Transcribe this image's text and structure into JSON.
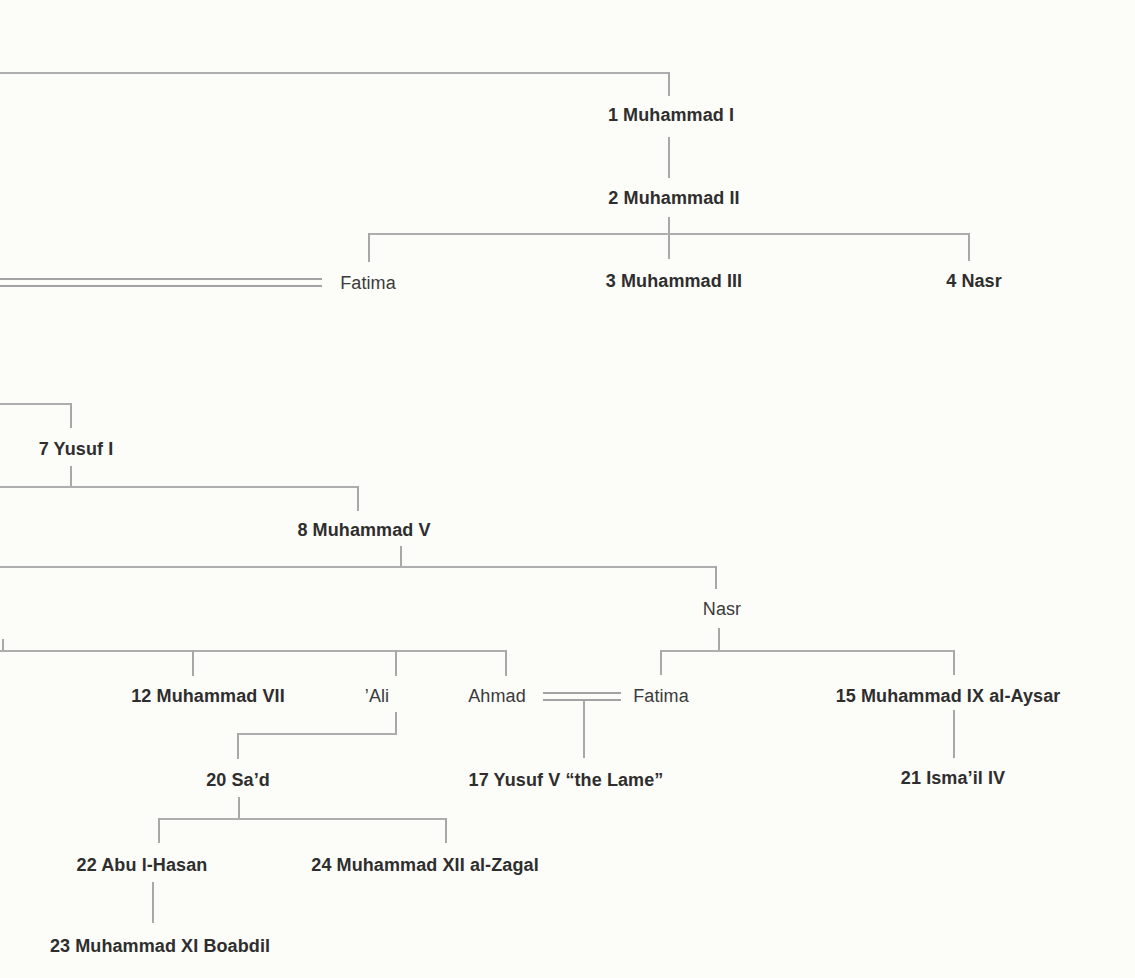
{
  "persons": {
    "muhammad_i": {
      "label": "1 Muhammad I"
    },
    "muhammad_ii": {
      "label": "2 Muhammad II"
    },
    "fatima_1": {
      "label": "Fatima"
    },
    "muhammad_iii": {
      "label": "3 Muhammad III"
    },
    "nasr_iv": {
      "label": "4 Nasr"
    },
    "yusuf_i": {
      "label": "7 Yusuf I"
    },
    "muhammad_v": {
      "label": "8 Muhammad V"
    },
    "nasr": {
      "label": "Nasr"
    },
    "muhammad_vii": {
      "label": "12 Muhammad VII"
    },
    "ali": {
      "label": "’Ali"
    },
    "ahmad": {
      "label": "Ahmad"
    },
    "fatima_2": {
      "label": "Fatima"
    },
    "muhammad_ix": {
      "label": "15 Muhammad IX al-Aysar"
    },
    "sad": {
      "label": "20 Sa’d"
    },
    "yusuf_v": {
      "label": "17 Yusuf V “the Lame”"
    },
    "ismail_iv": {
      "label": "21 Isma’il IV"
    },
    "abu_l_hasan": {
      "label": "22 Abu l-Hasan"
    },
    "muhammad_xii": {
      "label": "24 Muhammad XII al-Zagal"
    },
    "muhammad_xi": {
      "label": "23 Muhammad XI Boabdil"
    }
  },
  "colors": {
    "line": "#aeaeae",
    "marriage_line": "#a3a3a3",
    "text": "#2e2e2e",
    "background": "#fcfcf8"
  }
}
